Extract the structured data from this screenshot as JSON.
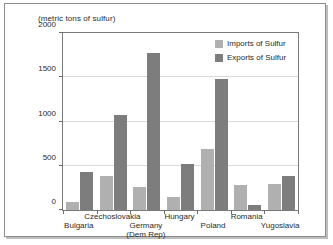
{
  "figure": {
    "title": "(metric tons of sulfur)"
  },
  "legend": {
    "position": "top-right",
    "items": [
      {
        "label": "Imports of Sulfur",
        "color": "#b0b0b0",
        "icon": "legend-swatch-icon"
      },
      {
        "label": "Exports of Sulfur",
        "color": "#7d7d7d",
        "icon": "legend-swatch-icon"
      }
    ]
  },
  "chart_data": {
    "type": "bar",
    "title": "(metric tons of sulfur)",
    "xlabel": "",
    "ylabel": "",
    "ylim": [
      0,
      2000
    ],
    "yticks": [
      0,
      500,
      1000,
      1500,
      2000
    ],
    "ytick_labels": [
      "0",
      "500",
      "1000",
      "1500",
      "2000"
    ],
    "grid": true,
    "legend_position": "top-right",
    "categories": [
      "Bulgaria",
      "Czechoslovakia",
      "Germany\n(Dem Rep)",
      "Hungary",
      "Poland",
      "Romania",
      "Yugoslavia"
    ],
    "category_lines": [
      {
        "line1": "Bulgaria",
        "line2": ""
      },
      {
        "line1": "Czechoslovakia",
        "line2": ""
      },
      {
        "line1": "Germany",
        "line2": "(Dem Rep)"
      },
      {
        "line1": "Hungary",
        "line2": ""
      },
      {
        "line1": "Poland",
        "line2": ""
      },
      {
        "line1": "Romania",
        "line2": ""
      },
      {
        "line1": "Yugoslavia",
        "line2": ""
      }
    ],
    "series": [
      {
        "name": "Imports of Sulfur",
        "color": "#b0b0b0",
        "values": [
          90,
          390,
          255,
          145,
          695,
          285,
          295
        ]
      },
      {
        "name": "Exports of Sulfur",
        "color": "#7d7d7d",
        "values": [
          430,
          1070,
          1775,
          515,
          1475,
          60,
          390
        ]
      }
    ]
  }
}
